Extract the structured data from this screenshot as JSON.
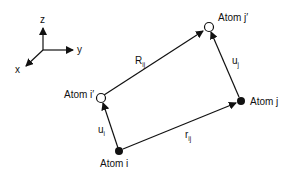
{
  "diagram": {
    "axes": {
      "z_label": "z",
      "y_label": "y",
      "x_label": "x"
    },
    "atoms": {
      "i": {
        "label": "Atom i",
        "style": "filled"
      },
      "j": {
        "label": "Atom j",
        "style": "filled"
      },
      "i_prime": {
        "label": "Atom i′",
        "style": "open"
      },
      "j_prime": {
        "label": "Atom j′",
        "style": "open"
      }
    },
    "vectors": {
      "R_ij": {
        "main": "R",
        "sub": "ij",
        "from": "Atom i′",
        "to": "Atom j′"
      },
      "r_ij": {
        "main": "r",
        "sub": "ij",
        "from": "Atom i",
        "to": "Atom j"
      },
      "u_i": {
        "main": "u",
        "sub": "i",
        "from": "Atom i",
        "to": "Atom i′"
      },
      "u_j": {
        "main": "u",
        "sub": "j",
        "from": "Atom j",
        "to": "Atom j′"
      }
    }
  }
}
